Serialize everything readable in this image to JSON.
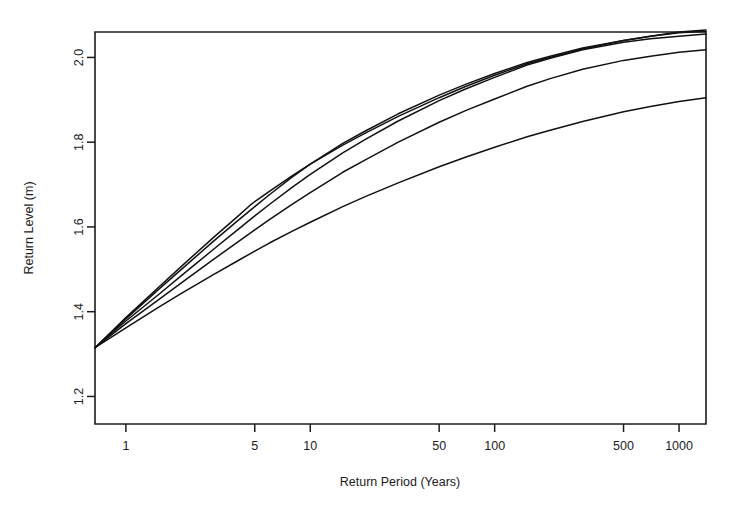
{
  "chart_data": {
    "type": "line",
    "title": "",
    "xlabel": "Return Period (Years)",
    "ylabel": "Return Level (m)",
    "xscale": "log",
    "yscale": "linear",
    "xlim": [
      0.68,
      1400
    ],
    "ylim": [
      1.135,
      2.06
    ],
    "xticks": [
      1,
      5,
      10,
      50,
      100,
      500,
      1000
    ],
    "xtick_labels": [
      "1",
      "5",
      "10",
      "50",
      "100",
      "500",
      "1000"
    ],
    "yticks": [
      1.2,
      1.4,
      1.6,
      1.8,
      2.0
    ],
    "ytick_labels": [
      "1.2",
      "1.4",
      "1.6",
      "1.8",
      "2.0"
    ],
    "grid": false,
    "legend": "none",
    "line_color": "#111111",
    "background": "#ffffff",
    "series": [
      {
        "name": "curve-1",
        "x": [
          0.68,
          1,
          1.5,
          2,
          3,
          4,
          4.8,
          5,
          6,
          8,
          10,
          15,
          20,
          30,
          50,
          70,
          100,
          150,
          200,
          300,
          500,
          700,
          1000,
          1400
        ],
        "values": [
          1.315,
          1.386,
          1.457,
          1.507,
          1.576,
          1.623,
          1.654,
          1.66,
          1.684,
          1.721,
          1.748,
          1.793,
          1.822,
          1.861,
          1.905,
          1.932,
          1.958,
          1.985,
          2.0,
          2.02,
          2.04,
          2.05,
          2.06,
          2.065
        ]
      },
      {
        "name": "curve-2",
        "x": [
          0.68,
          1,
          1.5,
          2,
          3,
          4,
          5,
          6,
          8,
          10,
          15,
          20,
          30,
          50,
          70,
          100,
          150,
          200,
          300,
          500,
          700,
          1000,
          1400
        ],
        "values": [
          1.315,
          1.383,
          1.452,
          1.5,
          1.567,
          1.613,
          1.648,
          1.676,
          1.718,
          1.748,
          1.797,
          1.827,
          1.867,
          1.911,
          1.937,
          1.962,
          1.988,
          2.003,
          2.022,
          2.04,
          2.05,
          2.058,
          2.062
        ]
      },
      {
        "name": "curve-3",
        "x": [
          0.68,
          1,
          1.5,
          2,
          3,
          4,
          5,
          6,
          8,
          10,
          15,
          20,
          30,
          50,
          70,
          100,
          150,
          200,
          300,
          500,
          700,
          1000,
          1400
        ],
        "values": [
          1.315,
          1.378,
          1.44,
          1.485,
          1.548,
          1.592,
          1.626,
          1.653,
          1.694,
          1.724,
          1.775,
          1.807,
          1.85,
          1.898,
          1.926,
          1.953,
          1.982,
          1.998,
          2.018,
          2.036,
          2.044,
          2.05,
          2.055
        ]
      },
      {
        "name": "curve-4",
        "x": [
          0.68,
          1,
          1.5,
          2,
          3,
          4,
          5,
          6,
          8,
          10,
          15,
          20,
          30,
          50,
          70,
          100,
          150,
          200,
          300,
          500,
          700,
          1000,
          1400
        ],
        "values": [
          1.315,
          1.372,
          1.428,
          1.468,
          1.524,
          1.563,
          1.593,
          1.617,
          1.654,
          1.681,
          1.729,
          1.759,
          1.8,
          1.847,
          1.875,
          1.902,
          1.932,
          1.95,
          1.972,
          1.993,
          2.003,
          2.012,
          2.018
        ]
      },
      {
        "name": "curve-5",
        "x": [
          0.68,
          1,
          1.5,
          2,
          3,
          4,
          5,
          6,
          8,
          10,
          15,
          20,
          30,
          50,
          70,
          100,
          150,
          200,
          300,
          500,
          700,
          1000,
          1400
        ],
        "values": [
          1.315,
          1.362,
          1.41,
          1.443,
          1.488,
          1.519,
          1.543,
          1.562,
          1.59,
          1.611,
          1.648,
          1.672,
          1.704,
          1.742,
          1.765,
          1.788,
          1.813,
          1.828,
          1.849,
          1.872,
          1.884,
          1.896,
          1.905
        ]
      }
    ]
  }
}
